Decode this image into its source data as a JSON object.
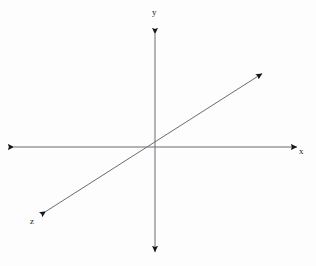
{
  "figure": {
    "width": 316,
    "height": 266,
    "background_color": "#fdfdfd",
    "line_color": "#6b6b72",
    "arrow_color": "#16161a",
    "label_color": "#1b1b1b",
    "line_width": 1
  },
  "chart_data": {
    "type": "scatter",
    "title": "",
    "subtitle": "",
    "xlabel": "x",
    "ylabel": "y",
    "zlabel": "z",
    "grid": false,
    "legend": null,
    "origin": {
      "x": 155,
      "y": 147
    },
    "axes": [
      {
        "name": "x-axis",
        "label": "x",
        "orientation": "horizontal",
        "arrowheads": "both",
        "start": {
          "x": 13,
          "y": 147
        },
        "end": {
          "x": 298,
          "y": 147
        },
        "label_position": {
          "x": 303,
          "y": 156
        }
      },
      {
        "name": "y-axis",
        "label": "y",
        "orientation": "vertical",
        "arrowheads": "both",
        "start": {
          "x": 155,
          "y": 33
        },
        "end": {
          "x": 155,
          "y": 253
        },
        "label_position": {
          "x": 156,
          "y": 17
        }
      },
      {
        "name": "z-axis",
        "label": "z",
        "orientation": "diagonal",
        "arrowheads": "both",
        "start": {
          "x": 45,
          "y": 212
        },
        "end": {
          "x": 263,
          "y": 73
        },
        "label_position": {
          "x": 34,
          "y": 226
        }
      }
    ]
  },
  "labels": {
    "x": "x",
    "y": "y",
    "z": "z"
  },
  "icons": {
    "arrowhead": "arrowhead-icon"
  }
}
